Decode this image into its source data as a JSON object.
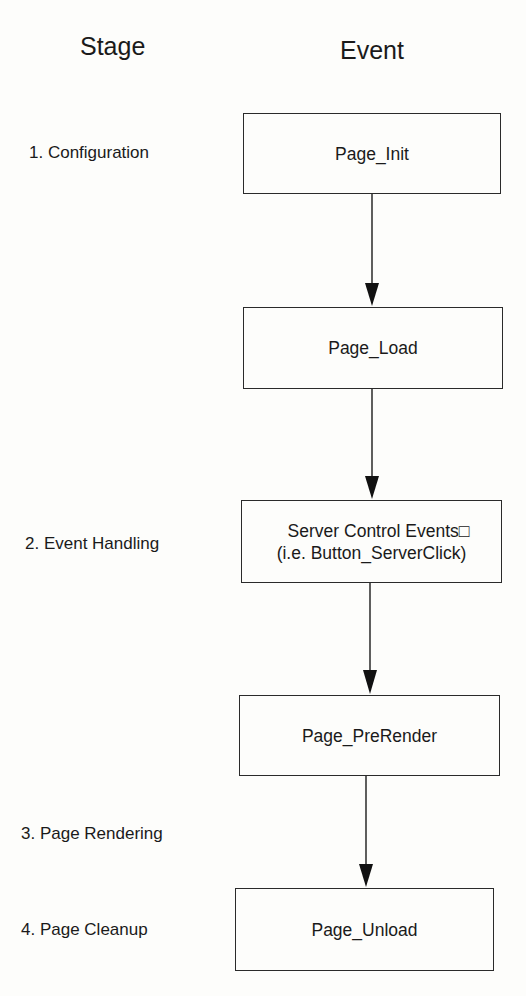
{
  "headers": {
    "stage": "Stage",
    "event": "Event"
  },
  "stages": [
    {
      "label": "1. Configuration"
    },
    {
      "label": "2. Event Handling"
    },
    {
      "label": "3. Page Rendering"
    },
    {
      "label": "4. Page Cleanup"
    }
  ],
  "events": [
    {
      "label": "Page_Init"
    },
    {
      "label": "Page_Load"
    },
    {
      "label": "Server Control Events□",
      "sublabel": "(i.e. Button_ServerClick)"
    },
    {
      "label": "Page_PreRender"
    },
    {
      "label": "Page_Unload"
    }
  ]
}
